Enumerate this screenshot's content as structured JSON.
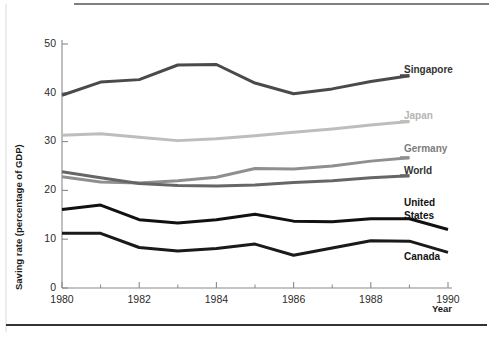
{
  "chart_data": {
    "type": "line",
    "title": "",
    "xlabel": "Year",
    "ylabel": "Saving rate (percentage of GDP)",
    "x": [
      1980,
      1981,
      1982,
      1983,
      1984,
      1985,
      1986,
      1987,
      1988,
      1989,
      1990
    ],
    "xlim": [
      1980,
      1990
    ],
    "ylim": [
      0,
      50
    ],
    "xticks": [
      1980,
      1982,
      1984,
      1986,
      1988,
      1990
    ],
    "xticklabels": [
      "1980",
      "1982",
      "1984",
      "1986",
      "1988",
      "1990"
    ],
    "yticks": [
      0,
      10,
      20,
      30,
      40,
      50
    ],
    "yticklabels": [
      "0",
      "10",
      "20",
      "30",
      "40",
      "50"
    ],
    "xminorticks": [
      1981,
      1983,
      1985,
      1987,
      1989
    ],
    "grid": false,
    "legend_position": "right-inline-labels",
    "series": [
      {
        "name": "Singapore",
        "color": "#4a4a4a",
        "width": 3.0,
        "label": "Singapore",
        "label_color": "#333333",
        "values": [
          39.5,
          42.2,
          42.7,
          45.7,
          45.8,
          42.0,
          39.8,
          40.8,
          42.3,
          43.5,
          null
        ]
      },
      {
        "name": "Japan",
        "color": "#bdbdbd",
        "width": 3.0,
        "label": "Japan",
        "label_color": "#b5b5b5",
        "values": [
          31.3,
          31.6,
          30.9,
          30.2,
          30.6,
          31.2,
          31.9,
          32.6,
          33.4,
          34.1,
          null
        ]
      },
      {
        "name": "Germany",
        "color": "#8f8f8f",
        "width": 3.0,
        "label": "Germany",
        "label_color": "#7d7d7d",
        "values": [
          22.8,
          21.7,
          21.5,
          22.0,
          22.7,
          24.5,
          24.4,
          25.0,
          26.0,
          26.7,
          null
        ]
      },
      {
        "name": "World",
        "color": "#666666",
        "width": 3.0,
        "label": "World",
        "label_color": "#333333",
        "values": [
          23.8,
          22.6,
          21.4,
          21.0,
          20.9,
          21.1,
          21.6,
          22.0,
          22.6,
          23.0,
          null
        ]
      },
      {
        "name": "United States",
        "color": "#111111",
        "width": 3.0,
        "label": "United\nStates",
        "label_color": "#111111",
        "values": [
          16.1,
          17.0,
          14.0,
          13.3,
          14.0,
          15.1,
          13.7,
          13.6,
          14.2,
          14.2,
          12.0
        ]
      },
      {
        "name": "Canada",
        "color": "#1a1a1a",
        "width": 3.0,
        "label": "Canada",
        "label_color": "#111111",
        "values": [
          11.2,
          11.2,
          8.3,
          7.6,
          8.1,
          9.0,
          6.7,
          8.2,
          9.7,
          9.6,
          7.3
        ]
      }
    ]
  },
  "labels": {
    "singapore": "Singapore",
    "japan": "Japan",
    "germany": "Germany",
    "world": "World",
    "united_states_line1": "United",
    "united_states_line2": "States",
    "canada": "Canada",
    "year_axis_title": "Year",
    "y_axis_title": "Saving rate (percentage of GDP)"
  },
  "ticks": {
    "y": [
      "50",
      "40",
      "30",
      "20",
      "10",
      "0"
    ],
    "x": [
      "1980",
      "1982",
      "1984",
      "1986",
      "1988",
      "1990"
    ]
  },
  "colors": {
    "singapore": "#4a4a4a",
    "japan": "#bdbdbd",
    "germany": "#8f8f8f",
    "world": "#666666",
    "united_states": "#111111",
    "canada": "#1a1a1a",
    "axis": "#8a8a8a",
    "text": "#1a1a1a",
    "background": "#ffffff"
  }
}
